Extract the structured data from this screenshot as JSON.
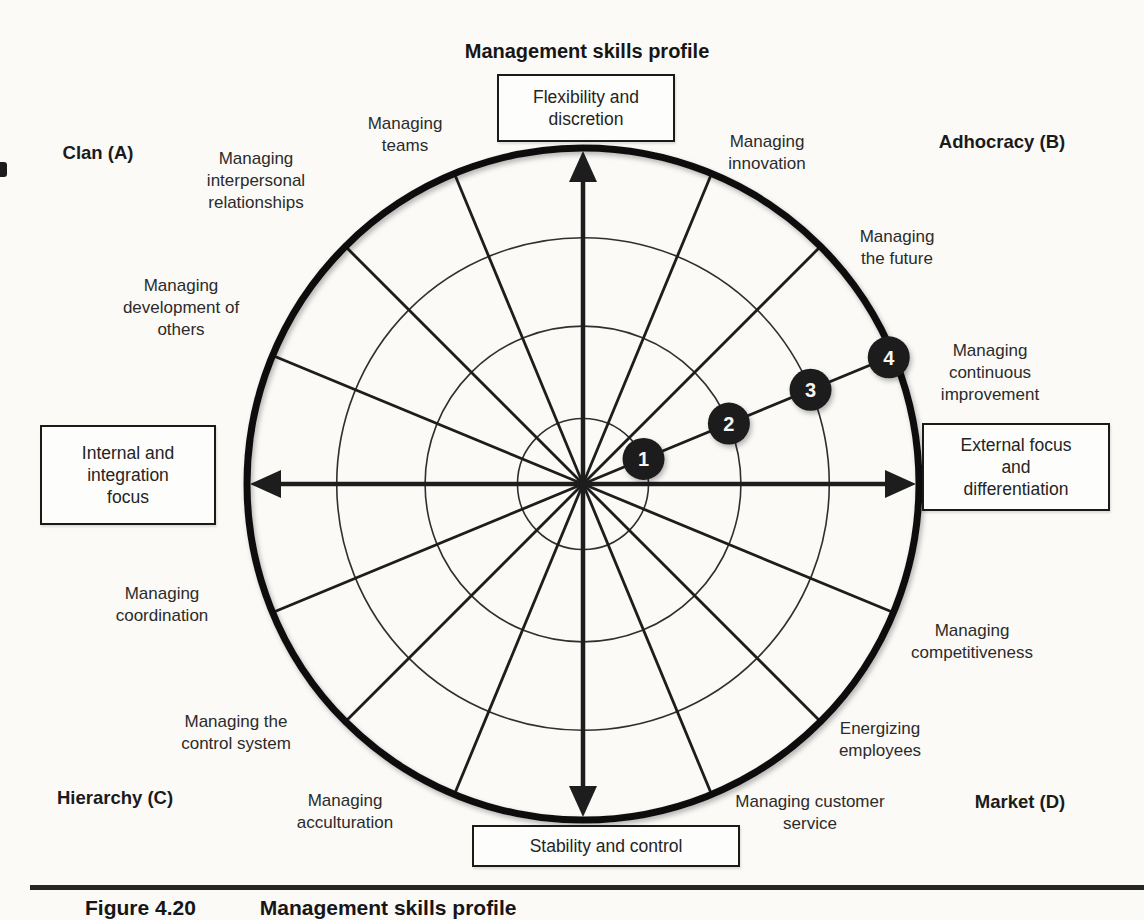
{
  "title": "Management skills profile",
  "quadrants": {
    "clan": "Clan (A)",
    "adhocracy": "Adhocracy (B)",
    "hierarchy": "Hierarchy (C)",
    "market": "Market (D)"
  },
  "axis_boxes": {
    "top": "Flexibility and\ndiscretion",
    "left": "Internal and\nintegration\nfocus",
    "right": "External focus\nand\ndifferentiation",
    "bottom": "Stability and control"
  },
  "skills": [
    {
      "id": "managing-teams",
      "label": "Managing\nteams"
    },
    {
      "id": "managing-interpersonal-relationships",
      "label": "Managing\ninterpersonal\nrelationships"
    },
    {
      "id": "managing-development-of-others",
      "label": "Managing\ndevelopment of\nothers"
    },
    {
      "id": "managing-innovation",
      "label": "Managing\ninnovation"
    },
    {
      "id": "managing-the-future",
      "label": "Managing\nthe future"
    },
    {
      "id": "managing-continuous-improvement",
      "label": "Managing\ncontinuous\nimprovement"
    },
    {
      "id": "managing-coordination",
      "label": "Managing\ncoordination"
    },
    {
      "id": "managing-the-control-system",
      "label": "Managing the\ncontrol system"
    },
    {
      "id": "managing-acculturation",
      "label": "Managing\nacculturation"
    },
    {
      "id": "managing-competitiveness",
      "label": "Managing\ncompetitiveness"
    },
    {
      "id": "energizing-employees",
      "label": "Energizing\nemployees"
    },
    {
      "id": "managing-customer-service",
      "label": "Managing customer\nservice"
    }
  ],
  "profile": {
    "skill": "Managing continuous improvement",
    "points": [
      {
        "label": "1"
      },
      {
        "label": "2"
      },
      {
        "label": "3"
      },
      {
        "label": "4"
      }
    ]
  },
  "caption": {
    "number": "Figure 4.20",
    "title": "Management skills profile"
  },
  "colors": {
    "ink": "#1c1c1c",
    "paper": "#fbfaf7"
  }
}
